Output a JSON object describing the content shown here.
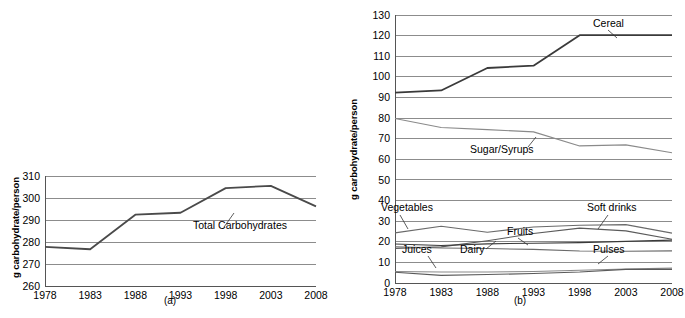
{
  "figure": {
    "panel_a_caption": "(a)",
    "panel_b_caption": "(b)",
    "ylabel": "g carbohydrate/person"
  },
  "chart_data": [
    {
      "type": "line",
      "panel": "(a)",
      "title": "",
      "xlabel": "",
      "ylabel": "g carbohydrate/person",
      "x": [
        1978,
        1983,
        1988,
        1993,
        1998,
        2003,
        2008
      ],
      "xticklabels": [
        "1978",
        "1983",
        "1988",
        "1993",
        "1998",
        "2003",
        "2008"
      ],
      "yticklabels": [
        "260",
        "270",
        "280",
        "290",
        "300",
        "310"
      ],
      "ylim": [
        260,
        310
      ],
      "yticks": [
        260,
        270,
        280,
        290,
        300,
        310
      ],
      "grid": true,
      "legend": "inline-annotation",
      "series": [
        {
          "name": "Total Carbohydrates",
          "values": [
            277.8,
            276.7,
            292.4,
            293.3,
            304.5,
            305.5,
            296.2
          ],
          "color": "#4a4a4a"
        }
      ]
    },
    {
      "type": "line",
      "panel": "(b)",
      "title": "",
      "xlabel": "",
      "ylabel": "g carbohydrate/person",
      "x": [
        1978,
        1983,
        1988,
        1993,
        1998,
        2003,
        2008
      ],
      "xticklabels": [
        "1978",
        "1983",
        "1988",
        "1993",
        "1998",
        "2003",
        "2008"
      ],
      "yticklabels": [
        "0",
        "10",
        "20",
        "30",
        "40",
        "50",
        "60",
        "70",
        "80",
        "90",
        "100",
        "110",
        "120",
        "130"
      ],
      "ylim": [
        0,
        130
      ],
      "yticks": [
        0,
        10,
        20,
        30,
        40,
        50,
        60,
        70,
        80,
        90,
        100,
        110,
        120,
        130
      ],
      "grid": true,
      "legend": "inline-annotation",
      "series": [
        {
          "name": "Cereal",
          "values": [
            92.3,
            93.4,
            104.3,
            105.4,
            120.2,
            120.2,
            120.2
          ],
          "color": "#3a3a3a"
        },
        {
          "name": "Sugar/Syrups",
          "values": [
            79.8,
            75.4,
            74.4,
            73.3,
            66.5,
            67.0,
            63.2
          ],
          "color": "#8a8a8a"
        },
        {
          "name": "Vegetables",
          "values": [
            24.3,
            27.5,
            24.6,
            27.2,
            28.0,
            28.3,
            24.2
          ],
          "color": "#6a6a6a"
        },
        {
          "name": "Soft drinks",
          "values": [
            16.8,
            17.5,
            20.5,
            24.0,
            26.6,
            25.3,
            21.2
          ],
          "color": "#5a5a5a"
        },
        {
          "name": "Fruits",
          "values": [
            18.9,
            18.2,
            19.0,
            19.3,
            19.6,
            20.2,
            20.8
          ],
          "color": "#3a3a3a"
        },
        {
          "name": "Dairy",
          "values": [
            17.6,
            17.0,
            16.7,
            16.3,
            15.5,
            15.4,
            15.6
          ],
          "color": "#6a6a6a"
        },
        {
          "name": "Juices",
          "values": [
            5.6,
            5.3,
            5.3,
            5.6,
            6.2,
            6.8,
            7.2
          ],
          "color": "#8a8a8a"
        },
        {
          "name": "Pulses",
          "values": [
            5.2,
            3.7,
            4.1,
            4.6,
            5.3,
            6.6,
            6.6
          ],
          "color": "#5a5a5a"
        }
      ]
    }
  ]
}
